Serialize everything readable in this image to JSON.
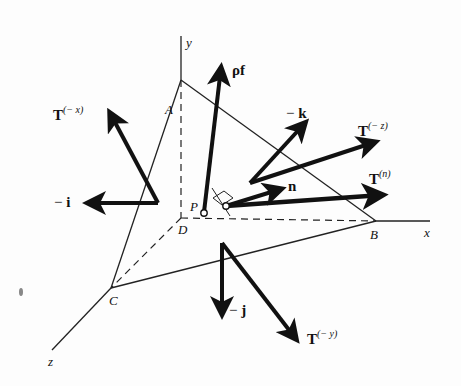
{
  "diagram": {
    "type": "tetrahedron-stress-diagram",
    "axes": {
      "x": {
        "label": "x"
      },
      "y": {
        "label": "y"
      },
      "z": {
        "label": "z"
      }
    },
    "points": {
      "A": {
        "label": "A"
      },
      "B": {
        "label": "B"
      },
      "C": {
        "label": "C"
      },
      "D": {
        "label": "D"
      },
      "P": {
        "label": "P"
      }
    },
    "vectors": {
      "body_force": {
        "label": "ρf"
      },
      "neg_k": {
        "minus": "−",
        "label": "k"
      },
      "T_neg_z": {
        "label": "T",
        "superscript": "(− z)"
      },
      "T_n": {
        "label": "T",
        "superscript": "(n)"
      },
      "n": {
        "label": "n"
      },
      "T_neg_x": {
        "label": "T",
        "superscript": "(− x)"
      },
      "neg_i": {
        "minus": "−",
        "label": "i"
      },
      "neg_j": {
        "minus": "−",
        "label": "j"
      },
      "T_neg_y": {
        "label": "T",
        "superscript": "(− y)"
      }
    },
    "colors": {
      "ink": "#111111",
      "background": "#fdfdfd"
    }
  }
}
